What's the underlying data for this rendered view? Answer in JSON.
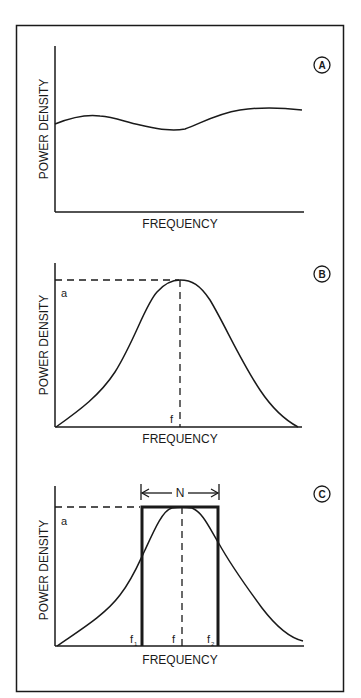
{
  "figure": {
    "panels": [
      {
        "id": "A",
        "badge": "A",
        "ylabel": "POWER DENSITY",
        "xlabel": "FREQUENCY",
        "curve": "flat, slightly wavy spectrum (white-noise-like)"
      },
      {
        "id": "B",
        "badge": "B",
        "ylabel": "POWER DENSITY",
        "xlabel": "FREQUENCY",
        "peak_label": "a",
        "center_label": "f",
        "curve": "bell-shaped spectrum peaking at center frequency f with amplitude a"
      },
      {
        "id": "C",
        "badge": "C",
        "ylabel": "POWER DENSITY",
        "xlabel": "FREQUENCY",
        "peak_label": "a",
        "center_label": "f",
        "f1_label": "f",
        "f1_sub": "1",
        "f2_label": "f",
        "f2_sub": "2",
        "bandwidth_label": "N",
        "curve": "bell-shaped spectrum with equivalent rectangular bandwidth N between f1 and f2"
      }
    ],
    "colors": {
      "ink": "#1a1a1a",
      "background": "#ffffff"
    }
  }
}
